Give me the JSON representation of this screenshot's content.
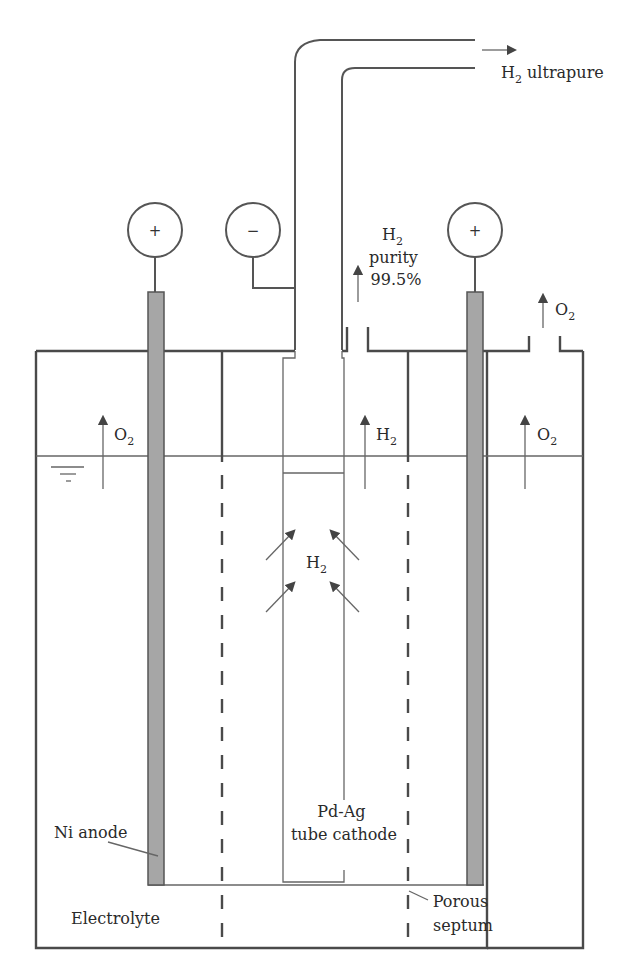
{
  "colors": {
    "line": "#4a4a4a",
    "electrode_fill": "#a6a6a6",
    "background": "#ffffff"
  },
  "terminals": [
    {
      "name": "left-anode-terminal",
      "sign": "+"
    },
    {
      "name": "cathode-terminal",
      "sign": "−"
    },
    {
      "name": "right-anode-terminal",
      "sign": "+"
    }
  ],
  "labels": {
    "h2_ultrapure": {
      "main": "H",
      "sub": "2",
      "rest": " ultrapure"
    },
    "h2_purity": {
      "line1_main": "H",
      "line1_sub": "2",
      "line2": "purity",
      "line3": "99.5%"
    },
    "o2_vent": {
      "main": "O",
      "sub": "2"
    },
    "o2_left": {
      "main": "O",
      "sub": "2"
    },
    "h2_mid": {
      "main": "H",
      "sub": "2"
    },
    "o2_right": {
      "main": "O",
      "sub": "2"
    },
    "h2_tube": {
      "main": "H",
      "sub": "2"
    },
    "cathode": {
      "line1": "Pd-Ag",
      "line2": "tube cathode"
    },
    "anode": "Ni anode",
    "electrolyte": "Electrolyte",
    "septum": {
      "line1": "Porous",
      "line2": "septum"
    }
  }
}
